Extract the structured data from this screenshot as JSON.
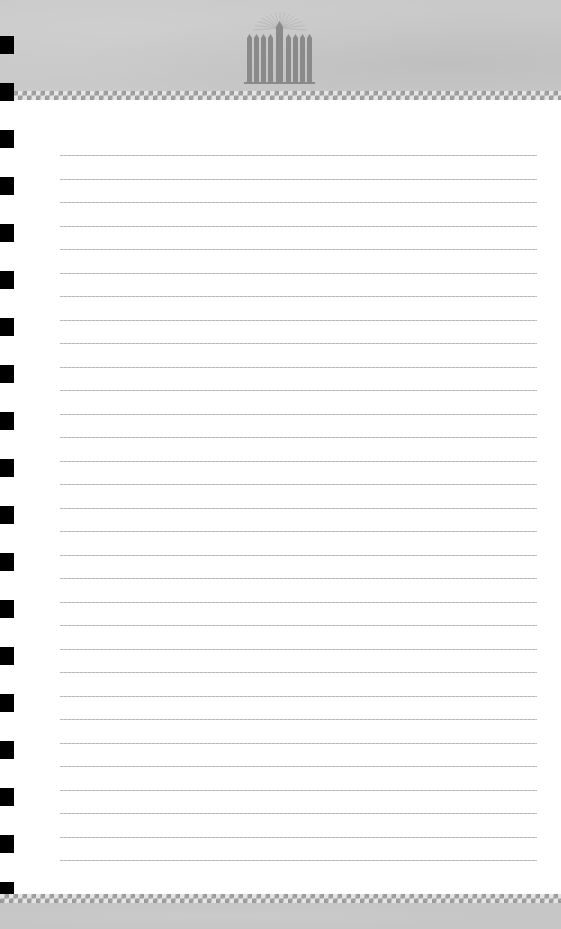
{
  "page": {
    "type": "lined-notebook-paper",
    "background_color": "#ffffff",
    "header_color": "#c9c9c9",
    "footer_color": "#c6c6c6",
    "line_color": "#bdbdbd",
    "hole_color": "#000000"
  },
  "header": {
    "logo": {
      "icon": "menorah-icon",
      "candle_count": 9,
      "color": "#8a8a8a"
    },
    "border": "checkered"
  },
  "footer": {
    "border": "checkered"
  },
  "lines": {
    "count": 31,
    "first_y": 155,
    "spacing": 23.5
  },
  "binder_holes": {
    "count": 19,
    "first_y": 36,
    "spacing": 47
  }
}
